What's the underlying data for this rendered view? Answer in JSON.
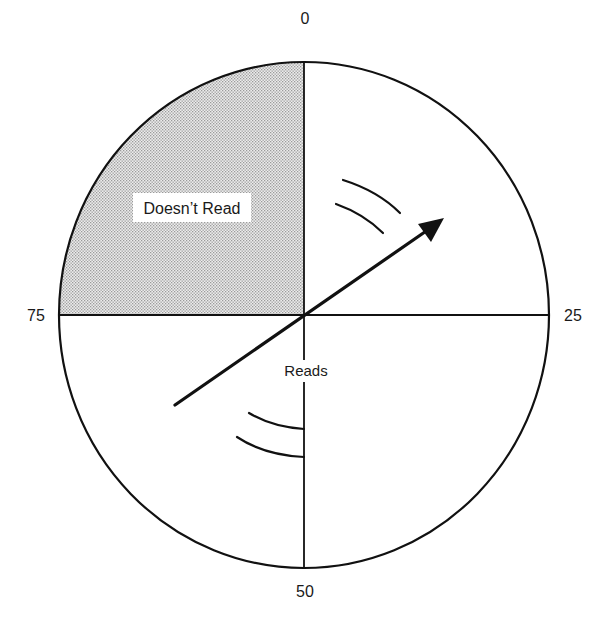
{
  "diagram": {
    "type": "dial-reading-zones",
    "dial_labels": {
      "top": "0",
      "right": "25",
      "bottom": "50",
      "left": "75"
    },
    "zones": [
      {
        "name": "doesnt-read",
        "label": "Doesn’t Read",
        "quadrant": "top-left",
        "shaded": true
      },
      {
        "name": "reads",
        "label": "Reads",
        "quadrant": "rest",
        "shaded": false
      }
    ],
    "pointer": {
      "description": "rotating arrow through center, head pointing upper-right",
      "rotation_marks": "two curved motion arcs near head and two near tail"
    },
    "colors": {
      "stroke": "#111111",
      "shade": "#bdbdbd",
      "background": "#ffffff"
    }
  }
}
